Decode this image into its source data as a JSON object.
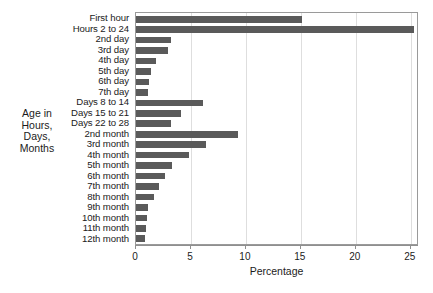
{
  "chart_data": {
    "type": "bar",
    "orientation": "horizontal",
    "title": "",
    "xlabel": "Percentage",
    "ylabel": "Age in\nHours,\nDays,\nMonths",
    "xlim": [
      0,
      25.75
    ],
    "xticks": [
      0,
      5,
      10,
      15,
      20,
      25
    ],
    "xtick_labels": [
      "0",
      "5",
      "10",
      "15",
      "20",
      "25"
    ],
    "grid": "vertical",
    "legend": "none",
    "bar_color": "#5a5a5a",
    "frame_color": "#9a9a9a",
    "gridline_color": "#dedede",
    "categories": [
      "First hour",
      "Hours 2 to 24",
      "2nd day",
      "3rd day",
      "4th day",
      "5th day",
      "6th day",
      "7th day",
      "Days 8 to 14",
      "Days 15 to 21",
      "Days 22 to 28",
      "2nd month",
      "3rd month",
      "4th month",
      "5th month",
      "6th month",
      "7th month",
      "8th month",
      "9th month",
      "10th month",
      "11th month",
      "12th month"
    ],
    "values": [
      15.1,
      25.3,
      3.2,
      2.9,
      1.8,
      1.4,
      1.2,
      1.1,
      6.1,
      4.1,
      3.2,
      9.3,
      6.4,
      4.8,
      3.3,
      2.6,
      2.1,
      1.6,
      1.1,
      1.0,
      0.95,
      0.85
    ]
  }
}
